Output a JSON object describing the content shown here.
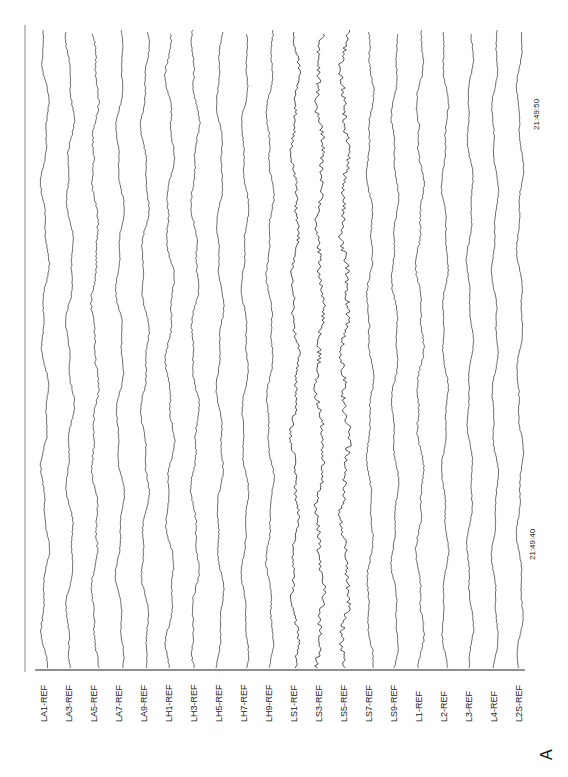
{
  "chart_data": {
    "type": "line",
    "title": "",
    "panel_label": "A",
    "orientation": "rotated-90 (time runs bottom to top)",
    "xlabel": "time",
    "ylabel": "channel",
    "time_ticks": [
      {
        "label": "21:49:40",
        "pos_y": 535
      },
      {
        "label": "21:49:50",
        "pos_y": 105
      }
    ],
    "channels": [
      {
        "name": "LA1-REF",
        "x": 45,
        "amp": 3.0,
        "noise": 0.6
      },
      {
        "name": "LA3-REF",
        "x": 70,
        "amp": 3.0,
        "noise": 0.6
      },
      {
        "name": "LA5-REF",
        "x": 95,
        "amp": 2.6,
        "noise": 0.9
      },
      {
        "name": "LA7-REF",
        "x": 120,
        "amp": 3.0,
        "noise": 0.5
      },
      {
        "name": "LA9-REF",
        "x": 145,
        "amp": 3.0,
        "noise": 0.6
      },
      {
        "name": "LH1-REF",
        "x": 170,
        "amp": 3.2,
        "noise": 0.7
      },
      {
        "name": "LH3-REF",
        "x": 195,
        "amp": 3.0,
        "noise": 0.8
      },
      {
        "name": "LH5-REF",
        "x": 220,
        "amp": 2.6,
        "noise": 0.6
      },
      {
        "name": "LH7-REF",
        "x": 245,
        "amp": 2.6,
        "noise": 0.6
      },
      {
        "name": "LH9-REF",
        "x": 270,
        "amp": 2.6,
        "noise": 0.7
      },
      {
        "name": "LS1-REF",
        "x": 295,
        "amp": 2.8,
        "noise": 1.6
      },
      {
        "name": "LS3-REF",
        "x": 320,
        "amp": 3.0,
        "noise": 2.2
      },
      {
        "name": "LS5-REF",
        "x": 345,
        "amp": 3.2,
        "noise": 2.6
      },
      {
        "name": "LS7-REF",
        "x": 370,
        "amp": 2.4,
        "noise": 0.8
      },
      {
        "name": "LS9-REF",
        "x": 395,
        "amp": 2.6,
        "noise": 0.6
      },
      {
        "name": "L1-REF",
        "x": 420,
        "amp": 2.8,
        "noise": 0.9
      },
      {
        "name": "L2-REF",
        "x": 445,
        "amp": 2.4,
        "noise": 0.6
      },
      {
        "name": "L3-REF",
        "x": 470,
        "amp": 2.4,
        "noise": 0.5
      },
      {
        "name": "L4-REF",
        "x": 495,
        "amp": 2.4,
        "noise": 0.5
      },
      {
        "name": "L2S-REF",
        "x": 520,
        "amp": 2.4,
        "noise": 0.5
      }
    ],
    "trace_top_y": 30,
    "trace_bottom_y": 668,
    "baseline_y": 670,
    "left_axis_x": 25,
    "grid": false,
    "legend": "none"
  },
  "labels": {
    "panel": "A",
    "t1": "21:49:40",
    "t2": "21:49:50"
  }
}
